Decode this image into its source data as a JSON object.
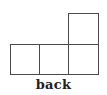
{
  "diagram": {
    "type": "orthographic-view",
    "view_label": "back",
    "grid": {
      "cell_size_px": 29,
      "stroke_color": "#4a4a4a",
      "cells": [
        {
          "row": 1,
          "col": 0,
          "x": 10,
          "y": 44
        },
        {
          "row": 1,
          "col": 1,
          "x": 39,
          "y": 44
        },
        {
          "row": 1,
          "col": 2,
          "x": 68,
          "y": 44
        },
        {
          "row": 0,
          "col": 2,
          "x": 68,
          "y": 14
        }
      ]
    }
  }
}
